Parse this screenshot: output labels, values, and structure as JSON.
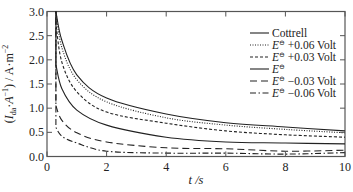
{
  "chart_data": {
    "type": "line",
    "title": "",
    "xlabel": "t /s",
    "ylabel": "(I_da·A⁻¹) / A·m⁻²",
    "xlim": [
      0,
      10
    ],
    "ylim": [
      0,
      3.0
    ],
    "xticks": [
      0,
      2,
      4,
      6,
      8,
      10
    ],
    "yticks": [
      0.0,
      0.5,
      1.0,
      1.5,
      2.0,
      2.5,
      3.0
    ],
    "xtick_labels": [
      "0",
      "2",
      "4",
      "6",
      "8",
      "10"
    ],
    "ytick_labels": [
      "0.0",
      "0.5",
      "1.0",
      "1.5",
      "2.0",
      "2.5",
      "3.0"
    ],
    "grid": false,
    "legend_position": "upper right",
    "x": [
      0.3,
      0.5,
      1,
      2,
      4,
      6,
      8,
      10
    ],
    "series": [
      {
        "name": "Cottrell",
        "style": "solid",
        "values": [
          3.0,
          2.4,
          1.69,
          1.21,
          0.88,
          0.7,
          0.61,
          0.53
        ]
      },
      {
        "name": "E⊖ +0.06 Volt",
        "style": "dotted",
        "values": [
          3.0,
          2.25,
          1.59,
          1.13,
          0.8,
          0.65,
          0.56,
          0.49
        ]
      },
      {
        "name": "E⊖ +0.03 Volt",
        "style": "dashed-short",
        "values": [
          2.75,
          1.95,
          1.34,
          0.92,
          0.69,
          0.53,
          0.45,
          0.4
        ]
      },
      {
        "name": "E⊖",
        "style": "solid",
        "values": [
          1.9,
          1.4,
          0.96,
          0.65,
          0.4,
          0.3,
          0.28,
          0.26
        ]
      },
      {
        "name": "E⊖ −0.03 Volt",
        "style": "dashed-long",
        "values": [
          1.05,
          0.75,
          0.49,
          0.3,
          0.18,
          0.16,
          0.11,
          0.13
        ]
      },
      {
        "name": "E⊖ −0.06 Volt",
        "style": "dash-dot",
        "values": [
          0.6,
          0.42,
          0.28,
          0.11,
          0.07,
          0.07,
          0.05,
          0.08
        ]
      }
    ]
  },
  "legend": {
    "items": [
      {
        "label_main": "Cottrell",
        "label_sup": "",
        "label_rest": ""
      },
      {
        "label_main": "E",
        "label_sup": "⊖",
        "label_rest": " +0.06 Volt"
      },
      {
        "label_main": "E",
        "label_sup": "⊖",
        "label_rest": " +0.03 Volt"
      },
      {
        "label_main": "E",
        "label_sup": "⊖",
        "label_rest": ""
      },
      {
        "label_main": "E",
        "label_sup": "⊖",
        "label_rest": " −0.03 Volt"
      },
      {
        "label_main": "E",
        "label_sup": "⊖",
        "label_rest": " −0.06 Volt"
      }
    ]
  },
  "axes": {
    "x_title_italic": "t",
    "x_title_rest": " /s",
    "y_title": "(I_da·A⁻¹) / A·m⁻²"
  }
}
